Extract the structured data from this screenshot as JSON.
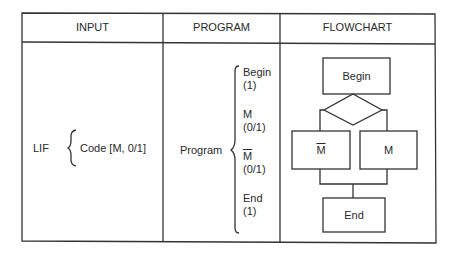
{
  "table": {
    "headers": [
      "INPUT",
      "PROGRAM",
      "FLOWCHART"
    ],
    "input": {
      "label": "LIF",
      "code": "Code [M, 0/1]"
    },
    "program": {
      "label": "Program",
      "steps": [
        {
          "name": "Begin",
          "count": "(1)",
          "overline": false
        },
        {
          "name": "M",
          "count": "(0/1)",
          "overline": false
        },
        {
          "name": "M",
          "count": "(0/1)",
          "overline": true
        },
        {
          "name": "End",
          "count": "(1)",
          "overline": false
        }
      ]
    },
    "flowchart": {
      "begin": "Begin",
      "branch_left": "M",
      "branch_left_overline": true,
      "branch_right": "M",
      "end": "End"
    }
  },
  "colors": {
    "line": "#333333",
    "text": "#2a2a2a",
    "background": "#ffffff"
  }
}
